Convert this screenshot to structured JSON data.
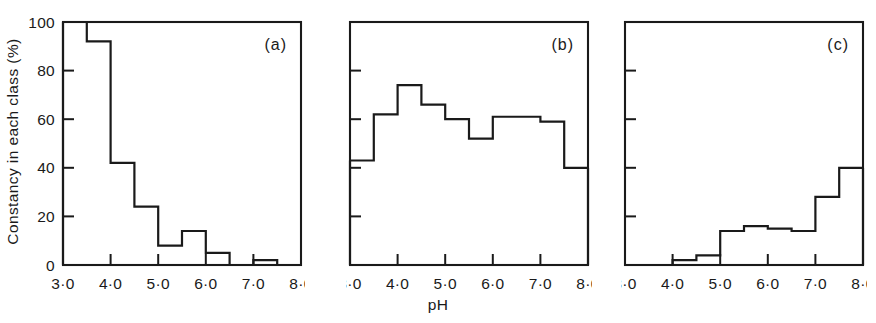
{
  "figure": {
    "ylabel": "Constancy in each class (%)",
    "xlabel": "pH",
    "panel_tags": [
      "(a)",
      "(b)",
      "(c)"
    ]
  },
  "axes": {
    "y_tick_labels": [
      "100",
      "80",
      "60",
      "40",
      "20",
      "0"
    ],
    "y_tick_values": [
      100,
      80,
      60,
      40,
      20,
      0
    ],
    "x_tick_labels": [
      "3·0",
      "4·0",
      "5·0",
      "6·0",
      "7·0",
      "8·0"
    ],
    "x_tick_values": [
      3.0,
      4.0,
      5.0,
      6.0,
      7.0,
      8.0
    ]
  },
  "chart_data": [
    {
      "type": "bar",
      "title": "(a)",
      "xlabel": "pH",
      "ylabel": "Constancy in each class (%)",
      "xlim": [
        3.0,
        8.0
      ],
      "ylim": [
        0,
        100
      ],
      "grid": false,
      "bin_width": 0.5,
      "bin_edges": [
        3.0,
        3.5,
        4.0,
        4.5,
        5.0,
        5.5,
        6.0,
        6.5,
        7.0,
        7.5,
        8.0
      ],
      "categories": [
        "3.0-3.5",
        "3.5-4.0",
        "4.0-4.5",
        "4.5-5.0",
        "5.0-5.5",
        "5.5-6.0",
        "6.0-6.5",
        "6.5-7.0",
        "7.0-7.5",
        "7.5-8.0"
      ],
      "values": [
        100,
        92,
        42,
        24,
        8,
        14,
        5,
        0,
        2,
        0
      ]
    },
    {
      "type": "bar",
      "title": "(b)",
      "xlabel": "pH",
      "ylabel": "Constancy in each class (%)",
      "xlim": [
        3.0,
        8.0
      ],
      "ylim": [
        0,
        100
      ],
      "grid": false,
      "bin_width": 0.5,
      "bin_edges": [
        3.0,
        3.5,
        4.0,
        4.5,
        5.0,
        5.5,
        6.0,
        6.5,
        7.0,
        7.5,
        8.0
      ],
      "categories": [
        "3.0-3.5",
        "3.5-4.0",
        "4.0-4.5",
        "4.5-5.0",
        "5.0-5.5",
        "5.5-6.0",
        "6.0-6.5",
        "6.5-7.0",
        "7.0-7.5",
        "7.5-8.0"
      ],
      "values": [
        43,
        62,
        74,
        66,
        60,
        52,
        61,
        61,
        59,
        40
      ]
    },
    {
      "type": "bar",
      "title": "(c)",
      "xlabel": "pH",
      "ylabel": "Constancy in each class (%)",
      "xlim": [
        3.0,
        8.0
      ],
      "ylim": [
        0,
        100
      ],
      "grid": false,
      "bin_width": 0.5,
      "bin_edges": [
        3.0,
        3.5,
        4.0,
        4.5,
        5.0,
        5.5,
        6.0,
        6.5,
        7.0,
        7.5,
        8.0
      ],
      "categories": [
        "3.0-3.5",
        "3.5-4.0",
        "4.0-4.5",
        "4.5-5.0",
        "5.0-5.5",
        "5.5-6.0",
        "6.0-6.5",
        "6.5-7.0",
        "7.0-7.5",
        "7.5-8.0"
      ],
      "values": [
        0,
        0,
        2,
        4,
        14,
        16,
        15,
        14,
        28,
        40
      ]
    }
  ],
  "layout": {
    "panels": [
      {
        "left": 63,
        "top": 22,
        "width": 238,
        "height": 243,
        "show_y_labels": true
      },
      {
        "left": 350,
        "top": 22,
        "width": 238,
        "height": 243,
        "show_y_labels": false
      },
      {
        "left": 625,
        "top": 22,
        "width": 238,
        "height": 243,
        "show_y_labels": false
      }
    ]
  }
}
